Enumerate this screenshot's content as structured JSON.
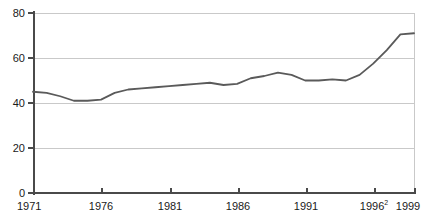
{
  "chart_data": {
    "type": "line",
    "title": "",
    "subtitle": "",
    "xlabel": "",
    "ylabel": "",
    "xlim": [
      1971,
      1999
    ],
    "ylim": [
      0,
      80
    ],
    "grid": true,
    "legend": false,
    "y_ticks": [
      0,
      20,
      40,
      60,
      80
    ],
    "y_tick_labels": [
      "0",
      "20",
      "40",
      "60",
      "80"
    ],
    "x_ticks": [
      1971,
      1976,
      1981,
      1986,
      1991,
      1996,
      1999
    ],
    "x_tick_labels": [
      "1971",
      "1976",
      "1981",
      "1986",
      "1991",
      "1996",
      "1999"
    ],
    "x_tick_footnotes": [
      "",
      "",
      "",
      "",
      "",
      "2",
      ""
    ],
    "line_color": "#5a5a5a",
    "grid_color": "#c9c9c9",
    "axis_color": "#4a4a4a",
    "background": "#ffffff",
    "x": [
      1971,
      1972,
      1973,
      1974,
      1975,
      1976,
      1977,
      1978,
      1979,
      1980,
      1981,
      1982,
      1983,
      1984,
      1985,
      1986,
      1987,
      1988,
      1989,
      1990,
      1991,
      1992,
      1993,
      1994,
      1995,
      1996,
      1997,
      1998,
      1999
    ],
    "values": [
      45.0,
      44.5,
      43.0,
      41.0,
      41.0,
      41.5,
      44.5,
      46.0,
      46.5,
      47.0,
      47.5,
      48.0,
      48.5,
      49.0,
      48.0,
      48.5,
      51.0,
      52.0,
      53.5,
      52.5,
      50.0,
      50.0,
      50.5,
      50.0,
      52.5,
      57.5,
      63.5,
      70.5,
      71.0
    ],
    "series": [
      {
        "name": "series-1",
        "values": [
          45.0,
          44.5,
          43.0,
          41.0,
          41.0,
          41.5,
          44.5,
          46.0,
          46.5,
          47.0,
          47.5,
          48.0,
          48.5,
          49.0,
          48.0,
          48.5,
          51.0,
          52.0,
          53.5,
          52.5,
          50.0,
          50.0,
          50.5,
          50.0,
          52.5,
          57.5,
          63.5,
          70.5,
          71.0
        ]
      }
    ]
  }
}
